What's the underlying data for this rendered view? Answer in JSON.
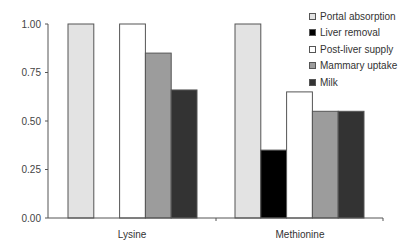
{
  "chart_data": {
    "type": "bar",
    "title": "",
    "xlabel": "",
    "ylabel": "",
    "categories": [
      "Lysine",
      "Methionine"
    ],
    "series": [
      {
        "name": "Portal absorption",
        "color": "#e3e3e3",
        "values": [
          1.0,
          1.0
        ]
      },
      {
        "name": "Liver removal",
        "color": "#000000",
        "values": [
          0.0,
          0.35
        ]
      },
      {
        "name": "Post-liver supply",
        "color": "#ffffff",
        "values": [
          1.0,
          0.65
        ]
      },
      {
        "name": "Mammary uptake",
        "color": "#9c9c9c",
        "values": [
          0.85,
          0.55
        ]
      },
      {
        "name": "Milk",
        "color": "#333333",
        "values": [
          0.66,
          0.55
        ]
      }
    ],
    "ylim": [
      0,
      1.0
    ],
    "yticks": [
      "0.00",
      "0.25",
      "0.50",
      "0.75",
      "1.00"
    ],
    "grid": false,
    "legend_position": "top-right"
  }
}
